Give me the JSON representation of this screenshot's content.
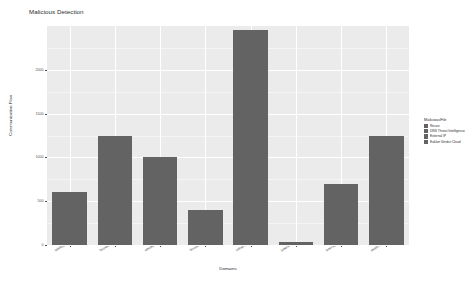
{
  "chart_data": {
    "type": "bar",
    "title": "Malicious Detection",
    "xlabel": "Domains",
    "ylabel": "Communication Flow",
    "categories": [
      "telelogger.com",
      "browsingfriends.biz",
      "whisky.to",
      "flourish.us",
      "cdnamplification.com",
      "jokersdeal.ch",
      "inter.app",
      "avatri.com"
    ],
    "values": [
      600,
      1250,
      1000,
      400,
      2450,
      30,
      700,
      1250
    ],
    "ylim": [
      0,
      2500
    ],
    "yticks": [
      0,
      500,
      1000,
      1500,
      2000
    ],
    "ytick_labels": [
      "0",
      "500",
      "1000",
      "1500",
      "2000"
    ],
    "grid": true,
    "bar_color": "#636363",
    "panel_color": "#ebebeb",
    "legend_position": "right",
    "series": [
      {
        "name": "MaliciousFile",
        "values": [
          600,
          1250,
          1000,
          400,
          2450,
          30,
          700,
          1250
        ]
      }
    ]
  },
  "legend": {
    "title": "MaliciousFile",
    "items": [
      {
        "label": "Recon",
        "color": "#636363"
      },
      {
        "label": "DNS Threat Intelligence",
        "color": "#636363"
      },
      {
        "label": "External IP",
        "color": "#636363"
      },
      {
        "label": "Eaklon Verdict Cloud",
        "color": "#636363"
      }
    ]
  }
}
